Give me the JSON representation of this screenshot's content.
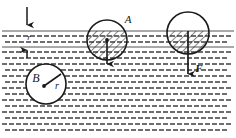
{
  "figure": {
    "type": "physics-buoyancy-diagram",
    "title_visible": false,
    "width": 236,
    "height": 138,
    "colors": {
      "ink": "#1a1a1a",
      "water_dash": "#6e6e6e",
      "surface_line": "#555555",
      "background": "#ffffff",
      "hatch": "#2a2a2a"
    },
    "labels": {
      "sphere_a": "A",
      "sphere_b": "B",
      "radius": "r",
      "depth": "r",
      "force": "F"
    },
    "water": {
      "dash_rows": 14,
      "dash_cols": 33,
      "surface_y": 31,
      "second_line_y": 47,
      "bottom_y": 136
    },
    "spheres": [
      {
        "name": "A",
        "cx": 107,
        "cy": 40,
        "r": 20,
        "submerged": "partial",
        "hatched": true,
        "center_dot": true,
        "arrow": "down"
      },
      {
        "name": "B",
        "cx": 46,
        "cy": 84,
        "r": 20,
        "submerged": "full",
        "hatched": false,
        "center_dot": true,
        "radius_line": true
      },
      {
        "name": "F-sphere",
        "cx": 188,
        "cy": 33,
        "r": 21,
        "submerged": "partial",
        "hatched": true,
        "center_dot": false,
        "arrow": "down"
      }
    ],
    "arrows": [
      {
        "name": "depth-arrow-down",
        "x": 27,
        "y1": 8,
        "y2": 31,
        "direction": "down"
      },
      {
        "name": "depth-arrow-up",
        "x": 27,
        "y1": 56,
        "y2": 47,
        "direction": "up"
      },
      {
        "name": "force-arrow-a",
        "x": 107,
        "y1": 40,
        "y2": 70,
        "direction": "down"
      },
      {
        "name": "force-arrow-f",
        "x": 188,
        "y1": 33,
        "y2": 80,
        "direction": "down"
      }
    ]
  }
}
